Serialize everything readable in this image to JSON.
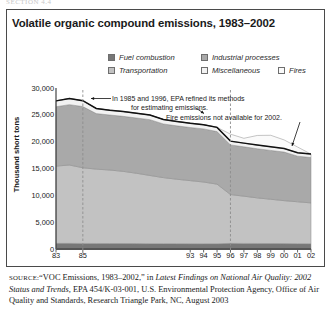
{
  "runhead": "SECTION 4.4",
  "title": "Volatile organic compound emissions, 1983–2002",
  "legend": {
    "items": [
      {
        "label": "Fuel combustion",
        "color": "#777777"
      },
      {
        "label": "Industrial processes",
        "color": "#a9a9a9"
      },
      {
        "label": "Transportation",
        "color": "#c2c2c2"
      },
      {
        "label": "Miscellaneous",
        "color": "#f2f2f2"
      },
      {
        "label": "Fires",
        "color": "#fafafa"
      }
    ]
  },
  "annotations": [
    {
      "name": "epa-methods-note-line1",
      "text": "In 1985 and 1996, EPA refined its methods"
    },
    {
      "name": "epa-methods-note-line2",
      "text": "for estimating emissions."
    },
    {
      "name": "fire-emissions-note",
      "text": "Fire emissions not available for 2002."
    }
  ],
  "source": {
    "label": "SOURCE:",
    "part1": "“VOC Emissions, 1983–2002,” in ",
    "italic1": "Latest Findings on National Air Quality: 2002 Status and Trends,",
    "part2": " EPA 454/K-03-001, U.S. Environmental Protection Agency, Office of Air Quality and Standards, Research Triangle Park, NC, August 2003"
  },
  "chart_data": {
    "type": "area",
    "title": "Volatile organic compound emissions, 1983–2002",
    "xlabel": "",
    "ylabel": "Thousand short tons",
    "ylim": [
      0,
      30000
    ],
    "yticks": [
      0,
      5000,
      10000,
      15000,
      20000,
      25000,
      30000
    ],
    "ytick_labels": [
      "0",
      "5,000",
      "10,000",
      "15,000",
      "20,000",
      "25,000",
      "30,000"
    ],
    "grid": false,
    "stacked": true,
    "legend_position": "top",
    "x": [
      1983,
      1984,
      1985,
      1986,
      1987,
      1988,
      1989,
      1990,
      1991,
      1992,
      1993,
      1994,
      1995,
      1996,
      1997,
      1998,
      1999,
      2000,
      2001,
      2002
    ],
    "xtick_values": [
      1983,
      1985,
      1993,
      1994,
      1995,
      1996,
      1997,
      1998,
      1999,
      2000,
      2001,
      2002
    ],
    "xtick_labels": [
      "83",
      "85",
      "93",
      "94",
      "95",
      "96",
      "97",
      "98",
      "99",
      "00",
      "01",
      "02"
    ],
    "series": [
      {
        "name": "Fuel combustion",
        "values": [
          1050,
          1050,
          1040,
          1030,
          1020,
          1020,
          1010,
          1000,
          1000,
          1000,
          990,
          980,
          980,
          1050,
          1040,
          1030,
          1020,
          1010,
          1000,
          990
        ]
      },
      {
        "name": "Industrial processes",
        "values": [
          11050,
          11250,
          11400,
          10350,
          10250,
          10250,
          10300,
          10400,
          10000,
          9950,
          9900,
          9900,
          9800,
          9250,
          9200,
          9150,
          9100,
          9050,
          8500,
          8450
        ]
      },
      {
        "name": "Transportation",
        "values": [
          14400,
          14600,
          14100,
          13850,
          13700,
          13450,
          13100,
          12700,
          12300,
          12000,
          11750,
          11500,
          11100,
          9100,
          8800,
          8500,
          8250,
          8000,
          7800,
          7600
        ]
      },
      {
        "name": "Miscellaneous",
        "values": [
          1100,
          1150,
          1100,
          950,
          900,
          900,
          880,
          860,
          840,
          820,
          800,
          790,
          780,
          700,
          690,
          680,
          670,
          660,
          650,
          640
        ]
      },
      {
        "name": "Fires",
        "values": [
          0,
          0,
          0,
          0,
          0,
          0,
          0,
          0,
          0,
          0,
          0,
          0,
          0,
          1300,
          900,
          1800,
          2150,
          1600,
          1050,
          0
        ]
      }
    ],
    "totals": [
      27600,
      28050,
      27640,
      26180,
      25870,
      25620,
      25290,
      24960,
      24140,
      23770,
      23440,
      23170,
      22660,
      21400,
      20630,
      21160,
      21190,
      20320,
      19000,
      17680
    ],
    "reference_lines": [
      {
        "name": "method-change-1985",
        "x": 1985,
        "style": "dashed"
      },
      {
        "name": "method-change-1996",
        "x": 1996,
        "style": "dashed"
      }
    ]
  }
}
